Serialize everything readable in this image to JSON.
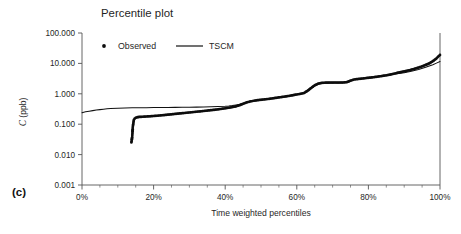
{
  "panel": {
    "label": "(c)"
  },
  "chart_data": {
    "type": "line",
    "title": "Percentile plot",
    "xlabel": "Time weighted percentiles",
    "ylabel": "C (ppb)",
    "ylabel_parts": {
      "symbol": "C",
      "units": " (ppb)"
    },
    "yscale": "log",
    "ylim": [
      0.001,
      100.0
    ],
    "xlim": [
      0,
      100
    ],
    "grid": false,
    "legend_position": "top-left-inside",
    "y_tick_labels": [
      "100.000",
      "10.000",
      "1.000",
      "0.100",
      "0.010",
      "0.001"
    ],
    "y_tick_values": [
      100.0,
      10.0,
      1.0,
      0.1,
      0.01,
      0.001
    ],
    "x_tick_labels": [
      "0%",
      "20%",
      "40%",
      "60%",
      "80%",
      "100%"
    ],
    "x_tick_values": [
      0,
      20,
      40,
      60,
      80,
      100
    ],
    "x_minor_step": 5,
    "legend": [
      {
        "name": "Observed",
        "marker": "dot",
        "color": "#0d0d0d"
      },
      {
        "name": "TSCM",
        "marker": "line",
        "color": "#111111"
      }
    ],
    "series": [
      {
        "name": "Observed",
        "style": "markers",
        "marker": "dot",
        "color": "#0d0d0d",
        "points": [
          [
            13.8,
            0.025
          ],
          [
            13.9,
            0.03
          ],
          [
            14.0,
            0.037
          ],
          [
            14.05,
            0.045
          ],
          [
            14.1,
            0.055
          ],
          [
            14.15,
            0.068
          ],
          [
            14.2,
            0.082
          ],
          [
            14.3,
            0.1
          ],
          [
            14.4,
            0.12
          ],
          [
            14.5,
            0.14
          ],
          [
            14.7,
            0.152
          ],
          [
            15.0,
            0.162
          ],
          [
            15.5,
            0.17
          ],
          [
            16.0,
            0.173
          ],
          [
            17.0,
            0.176
          ],
          [
            18.0,
            0.179
          ],
          [
            19.0,
            0.182
          ],
          [
            20.0,
            0.186
          ],
          [
            21.0,
            0.19
          ],
          [
            22.0,
            0.195
          ],
          [
            23.0,
            0.2
          ],
          [
            24.0,
            0.206
          ],
          [
            25.0,
            0.212
          ],
          [
            26.0,
            0.218
          ],
          [
            27.0,
            0.224
          ],
          [
            28.0,
            0.23
          ],
          [
            29.0,
            0.236
          ],
          [
            30.0,
            0.243
          ],
          [
            31.0,
            0.25
          ],
          [
            32.0,
            0.257
          ],
          [
            33.0,
            0.264
          ],
          [
            34.0,
            0.272
          ],
          [
            35.0,
            0.28
          ],
          [
            36.0,
            0.289
          ],
          [
            37.0,
            0.298
          ],
          [
            38.0,
            0.308
          ],
          [
            39.0,
            0.32
          ],
          [
            40.0,
            0.333
          ],
          [
            41.0,
            0.348
          ],
          [
            42.0,
            0.365
          ],
          [
            43.0,
            0.385
          ],
          [
            44.0,
            0.42
          ],
          [
            45.0,
            0.47
          ],
          [
            46.0,
            0.52
          ],
          [
            47.0,
            0.56
          ],
          [
            48.0,
            0.59
          ],
          [
            49.0,
            0.615
          ],
          [
            50.0,
            0.635
          ],
          [
            51.0,
            0.655
          ],
          [
            52.0,
            0.675
          ],
          [
            53.0,
            0.7
          ],
          [
            54.0,
            0.73
          ],
          [
            55.0,
            0.76
          ],
          [
            56.0,
            0.79
          ],
          [
            57.0,
            0.82
          ],
          [
            58.0,
            0.86
          ],
          [
            59.0,
            0.9
          ],
          [
            60.0,
            0.95
          ],
          [
            61.0,
            1.0
          ],
          [
            62.0,
            1.06
          ],
          [
            63.0,
            1.25
          ],
          [
            64.0,
            1.55
          ],
          [
            65.0,
            1.9
          ],
          [
            66.0,
            2.15
          ],
          [
            67.0,
            2.28
          ],
          [
            68.0,
            2.32
          ],
          [
            69.0,
            2.33
          ],
          [
            70.0,
            2.335
          ],
          [
            71.0,
            2.34
          ],
          [
            72.0,
            2.345
          ],
          [
            73.0,
            2.35
          ],
          [
            74.0,
            2.42
          ],
          [
            75.0,
            2.7
          ],
          [
            76.0,
            2.95
          ],
          [
            77.0,
            3.05
          ],
          [
            78.0,
            3.15
          ],
          [
            79.0,
            3.25
          ],
          [
            80.0,
            3.35
          ],
          [
            81.0,
            3.46
          ],
          [
            82.0,
            3.58
          ],
          [
            83.0,
            3.72
          ],
          [
            84.0,
            3.88
          ],
          [
            85.0,
            4.05
          ],
          [
            86.0,
            4.25
          ],
          [
            87.0,
            4.55
          ],
          [
            88.0,
            4.85
          ],
          [
            89.0,
            5.15
          ],
          [
            90.0,
            5.45
          ],
          [
            91.0,
            5.8
          ],
          [
            92.0,
            6.2
          ],
          [
            93.0,
            6.7
          ],
          [
            94.0,
            7.3
          ],
          [
            95.0,
            8.0
          ],
          [
            96.0,
            8.9
          ],
          [
            97.0,
            10.0
          ],
          [
            98.0,
            11.8
          ],
          [
            99.0,
            14.5
          ],
          [
            99.5,
            16.8
          ],
          [
            100.0,
            19.0
          ]
        ]
      },
      {
        "name": "TSCM",
        "style": "line",
        "color": "#111111",
        "points": [
          [
            0.0,
            0.24
          ],
          [
            1.0,
            0.255
          ],
          [
            2.0,
            0.268
          ],
          [
            3.0,
            0.28
          ],
          [
            4.0,
            0.292
          ],
          [
            5.0,
            0.302
          ],
          [
            6.0,
            0.312
          ],
          [
            7.0,
            0.32
          ],
          [
            8.0,
            0.328
          ],
          [
            10.0,
            0.336
          ],
          [
            12.0,
            0.341
          ],
          [
            14.0,
            0.345
          ],
          [
            16.0,
            0.348
          ],
          [
            18.0,
            0.35
          ],
          [
            20.0,
            0.352
          ],
          [
            22.0,
            0.354
          ],
          [
            24.0,
            0.356
          ],
          [
            26.0,
            0.358
          ],
          [
            28.0,
            0.36
          ],
          [
            30.0,
            0.362
          ],
          [
            32.0,
            0.364
          ],
          [
            34.0,
            0.368
          ],
          [
            36.0,
            0.374
          ],
          [
            38.0,
            0.382
          ],
          [
            40.0,
            0.392
          ],
          [
            41.0,
            0.4
          ],
          [
            42.0,
            0.412
          ],
          [
            43.0,
            0.43
          ],
          [
            44.0,
            0.45
          ],
          [
            45.0,
            0.48
          ],
          [
            46.0,
            0.52
          ],
          [
            47.0,
            0.56
          ],
          [
            48.0,
            0.592
          ],
          [
            49.0,
            0.616
          ],
          [
            50.0,
            0.636
          ],
          [
            52.0,
            0.676
          ],
          [
            54.0,
            0.731
          ],
          [
            56.0,
            0.791
          ],
          [
            58.0,
            0.861
          ],
          [
            60.0,
            0.951
          ],
          [
            62.0,
            1.062
          ],
          [
            64.0,
            1.55
          ],
          [
            66.0,
            2.15
          ],
          [
            68.0,
            2.322
          ],
          [
            70.0,
            2.335
          ],
          [
            72.0,
            2.345
          ],
          [
            74.0,
            2.42
          ],
          [
            76.0,
            2.95
          ],
          [
            78.0,
            3.15
          ],
          [
            80.0,
            3.35
          ],
          [
            82.0,
            3.58
          ],
          [
            84.0,
            3.88
          ],
          [
            86.0,
            4.2
          ],
          [
            88.0,
            4.6
          ],
          [
            90.0,
            4.95
          ],
          [
            92.0,
            5.5
          ],
          [
            94.0,
            6.3
          ],
          [
            96.0,
            7.5
          ],
          [
            98.0,
            9.1
          ],
          [
            99.0,
            10.2
          ],
          [
            100.0,
            11.5
          ]
        ]
      }
    ]
  }
}
